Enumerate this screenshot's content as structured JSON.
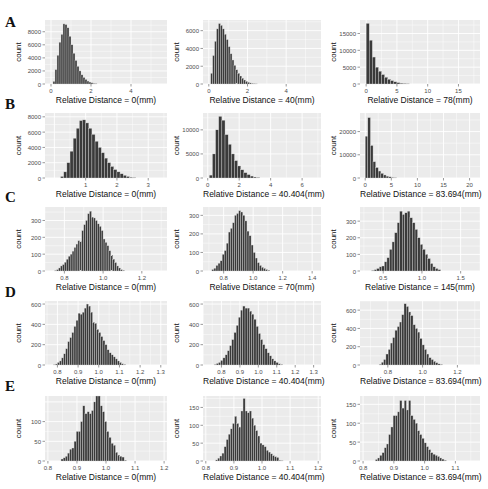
{
  "figure": {
    "rows": [
      "A",
      "B",
      "C",
      "D",
      "E"
    ],
    "colors": {
      "panel_bg": "#ebebeb",
      "grid": "#ffffff",
      "bar_fill": "#3a3a3a",
      "bar_edge": "#d9d9d9",
      "text": "#111111",
      "tick_text": "#4d4d4d"
    },
    "ylabel": "count"
  },
  "chart_data": [
    {
      "id": "A1",
      "row": "A",
      "type": "bar",
      "title": "",
      "xlabel": "Relative Distance = 0(mm)",
      "ylabel": "count",
      "xlim": [
        -0.3,
        5.8
      ],
      "ylim": [
        0,
        9800
      ],
      "xticks": [
        0,
        2,
        4
      ],
      "yticks": [
        0,
        2000,
        4000,
        6000,
        8000
      ],
      "bin_start": 0.1,
      "bin_width": 0.1,
      "values": [
        400,
        2200,
        4400,
        6400,
        7600,
        9200,
        9100,
        8600,
        7300,
        6000,
        4700,
        3600,
        2700,
        2000,
        1400,
        1000,
        700,
        450,
        300,
        180,
        100,
        60
      ]
    },
    {
      "id": "A2",
      "row": "A",
      "type": "bar",
      "title": "",
      "xlabel": "Relative Distance = 40(mm)",
      "ylabel": "count",
      "xlim": [
        -0.3,
        5.8
      ],
      "ylim": [
        0,
        7200
      ],
      "xticks": [
        0,
        2,
        4
      ],
      "yticks": [
        0,
        2000,
        4000,
        6000
      ],
      "bin_start": 0.1,
      "bin_width": 0.1,
      "values": [
        1200,
        3200,
        4800,
        6200,
        6800,
        6600,
        6200,
        5600,
        5000,
        4200,
        3400,
        2700,
        2100,
        1600,
        1200,
        900,
        650,
        450,
        300,
        200,
        120,
        70,
        40,
        20
      ]
    },
    {
      "id": "A3",
      "row": "A",
      "type": "bar",
      "title": "",
      "xlabel": "Relative Distance = 78(mm)",
      "ylabel": "count",
      "xlim": [
        -1,
        18.5
      ],
      "ylim": [
        0,
        19000
      ],
      "xticks": [
        0,
        5,
        10,
        15
      ],
      "yticks": [
        0,
        5000,
        10000,
        15000
      ],
      "bin_start": 0,
      "bin_width": 0.5,
      "values": [
        18000,
        13000,
        8000,
        5000,
        3800,
        2800,
        2000,
        1400,
        1000,
        650,
        400,
        250,
        150,
        80
      ]
    },
    {
      "id": "B1",
      "row": "B",
      "type": "bar",
      "title": "",
      "xlabel": "Relative Distance = 0(mm)",
      "ylabel": "count",
      "xlim": [
        -0.3,
        3.6
      ],
      "ylim": [
        0,
        8500
      ],
      "xticks": [
        1,
        2,
        3
      ],
      "yticks": [
        0,
        2000,
        4000,
        6000,
        8000
      ],
      "bin_start": 0.2,
      "bin_width": 0.1,
      "values": [
        200,
        800,
        2000,
        3500,
        5200,
        6500,
        7500,
        7600,
        7200,
        6500,
        5700,
        4800,
        4000,
        3300,
        2600,
        2000,
        1500,
        1100,
        800,
        550,
        350,
        200,
        100,
        50
      ]
    },
    {
      "id": "B2",
      "row": "B",
      "type": "bar",
      "title": "",
      "xlabel": "Relative Distance = 40.404(mm)",
      "ylabel": "count",
      "xlim": [
        -0.3,
        7.2
      ],
      "ylim": [
        0,
        13500
      ],
      "xticks": [
        0,
        2,
        4,
        6
      ],
      "yticks": [
        0,
        5000,
        10000
      ],
      "bin_start": 0.1,
      "bin_width": 0.2,
      "values": [
        600,
        5000,
        10000,
        12800,
        12000,
        9000,
        7000,
        5000,
        3600,
        2500,
        1700,
        1100,
        700,
        400,
        200,
        100
      ]
    },
    {
      "id": "B3",
      "row": "B",
      "type": "bar",
      "title": "",
      "xlabel": "Relative Distance = 83.694(mm)",
      "ylabel": "count",
      "xlim": [
        -1,
        22
      ],
      "ylim": [
        0,
        28000
      ],
      "xticks": [
        0,
        5,
        10,
        15,
        20
      ],
      "yticks": [
        0,
        10000,
        20000
      ],
      "bin_start": 0,
      "bin_width": 0.5,
      "values": [
        18000,
        26000,
        14000,
        7000,
        4500,
        3000,
        2000,
        1300,
        800,
        500,
        250,
        120
      ]
    },
    {
      "id": "C1",
      "row": "C",
      "type": "bar",
      "title": "",
      "xlabel": "Relative Distance = 0(mm)",
      "ylabel": "count",
      "xlim": [
        0.7,
        1.33
      ],
      "ylim": [
        0,
        380
      ],
      "xticks": [
        0.8,
        1.0,
        1.2
      ],
      "yticks": [
        0,
        100,
        200,
        300
      ],
      "bin_start": 0.75,
      "bin_width": 0.01,
      "values": [
        3,
        8,
        18,
        30,
        38,
        52,
        70,
        88,
        100,
        118,
        140,
        160,
        180,
        175,
        240,
        275,
        300,
        340,
        355,
        320,
        315,
        300,
        280,
        265,
        240,
        190,
        170,
        150,
        120,
        95,
        70,
        50,
        30,
        18,
        8,
        4
      ]
    },
    {
      "id": "C2",
      "row": "C",
      "type": "bar",
      "title": "",
      "xlabel": "Relative Distance = 70(mm)",
      "ylabel": "count",
      "xlim": [
        0.66,
        1.46
      ],
      "ylim": [
        0,
        345
      ],
      "xticks": [
        0.8,
        1.0,
        1.2,
        1.4
      ],
      "yticks": [
        0,
        100,
        200,
        300
      ],
      "bin_start": 0.72,
      "bin_width": 0.014,
      "values": [
        8,
        15,
        30,
        42,
        55,
        90,
        110,
        150,
        210,
        230,
        260,
        300,
        310,
        325,
        318,
        300,
        270,
        215,
        190,
        140,
        100,
        70,
        45,
        30,
        20,
        14,
        8,
        4
      ]
    },
    {
      "id": "C3",
      "row": "C",
      "type": "bar",
      "title": "",
      "xlabel": "Relative Distance = 145(mm)",
      "ylabel": "count",
      "xlim": [
        0.2,
        1.75
      ],
      "ylim": [
        0,
        385
      ],
      "xticks": [
        0.5,
        1.0,
        1.5
      ],
      "yticks": [
        0,
        100,
        200,
        300
      ],
      "bin_start": 0.35,
      "bin_width": 0.033,
      "values": [
        3,
        8,
        15,
        25,
        30,
        55,
        80,
        130,
        175,
        230,
        290,
        360,
        340,
        350,
        360,
        320,
        290,
        250,
        200,
        160,
        130,
        100,
        75,
        45,
        25,
        15,
        8
      ]
    },
    {
      "id": "D1",
      "row": "D",
      "type": "bar",
      "title": "",
      "xlabel": "Relative Distance = 0(mm)",
      "ylabel": "count",
      "xlim": [
        0.74,
        1.33
      ],
      "ylim": [
        0,
        630
      ],
      "xticks": [
        0.8,
        0.9,
        1.0,
        1.1,
        1.2,
        1.3
      ],
      "yticks": [
        0,
        200,
        400,
        600
      ],
      "bin_start": 0.78,
      "bin_width": 0.01,
      "values": [
        3,
        10,
        25,
        40,
        70,
        110,
        160,
        230,
        270,
        320,
        380,
        440,
        510,
        500,
        520,
        560,
        600,
        580,
        520,
        420,
        410,
        350,
        320,
        280,
        240,
        200,
        150,
        120,
        100,
        80,
        60,
        40,
        25,
        12,
        5
      ]
    },
    {
      "id": "D2",
      "row": "D",
      "type": "bar",
      "title": "",
      "xlabel": "Relative Distance = 40.404(mm)",
      "ylabel": "count",
      "xlim": [
        0.7,
        1.34
      ],
      "ylim": [
        0,
        630
      ],
      "xticks": [
        0.8,
        0.9,
        1.0,
        1.1,
        1.2,
        1.3
      ],
      "yticks": [
        0,
        200,
        400,
        600
      ],
      "bin_start": 0.76,
      "bin_width": 0.012,
      "values": [
        5,
        15,
        25,
        45,
        70,
        100,
        140,
        190,
        250,
        320,
        390,
        470,
        540,
        580,
        560,
        560,
        530,
        500,
        450,
        380,
        310,
        250,
        200,
        160,
        120,
        90,
        60,
        40,
        25,
        12,
        5
      ]
    },
    {
      "id": "D3",
      "row": "D",
      "type": "bar",
      "title": "",
      "xlabel": "Relative Distance = 83.694(mm)",
      "ylabel": "count",
      "xlim": [
        0.64,
        1.33
      ],
      "ylim": [
        0,
        700
      ],
      "xticks": [
        0.8,
        1.0,
        1.2
      ],
      "yticks": [
        0,
        200,
        400,
        600
      ],
      "bin_start": 0.75,
      "bin_width": 0.013,
      "values": [
        8,
        30,
        60,
        120,
        170,
        240,
        300,
        380,
        420,
        470,
        550,
        670,
        640,
        580,
        540,
        440,
        400,
        360,
        290,
        220,
        170,
        120,
        80,
        60,
        40,
        25,
        12,
        6
      ]
    },
    {
      "id": "E1",
      "row": "E",
      "type": "bar",
      "title": "",
      "xlabel": "Relative Distance = 0(mm)",
      "ylabel": "count",
      "xlim": [
        0.79,
        1.21
      ],
      "ylim": [
        0,
        165
      ],
      "xticks": [
        0.8,
        0.9,
        1.0,
        1.1,
        1.2
      ],
      "yticks": [
        0,
        50,
        100
      ],
      "bin_start": 0.845,
      "bin_width": 0.0075,
      "values": [
        5,
        8,
        12,
        20,
        30,
        33,
        50,
        75,
        75,
        100,
        140,
        120,
        125,
        120,
        128,
        150,
        165,
        165,
        140,
        125,
        100,
        75,
        60,
        45,
        40,
        22,
        15,
        12,
        10,
        2
      ]
    },
    {
      "id": "E2",
      "row": "E",
      "type": "bar",
      "title": "",
      "xlabel": "Relative Distance = 40.404(mm)",
      "ylabel": "count",
      "xlim": [
        0.79,
        1.21
      ],
      "ylim": [
        0,
        182
      ],
      "xticks": [
        0.8,
        0.9,
        1.0,
        1.1,
        1.2
      ],
      "yticks": [
        0,
        50,
        100,
        150
      ],
      "bin_start": 0.835,
      "bin_width": 0.0075,
      "values": [
        3,
        8,
        14,
        22,
        40,
        60,
        75,
        90,
        105,
        125,
        105,
        95,
        140,
        175,
        140,
        135,
        140,
        120,
        100,
        85,
        70,
        50,
        45,
        40,
        30,
        25,
        20,
        15,
        12,
        10,
        2,
        1
      ]
    },
    {
      "id": "E3",
      "row": "E",
      "type": "bar",
      "title": "",
      "xlabel": "Relative Distance = 83.694(mm)",
      "ylabel": "count",
      "xlim": [
        0.79,
        1.18
      ],
      "ylim": [
        0,
        172
      ],
      "xticks": [
        0.8,
        0.9,
        1.0,
        1.1
      ],
      "yticks": [
        0,
        50,
        100,
        150
      ],
      "bin_start": 0.84,
      "bin_width": 0.0072,
      "values": [
        4,
        8,
        15,
        22,
        35,
        45,
        70,
        90,
        120,
        120,
        130,
        160,
        140,
        160,
        135,
        160,
        120,
        110,
        100,
        80,
        70,
        60,
        48,
        38,
        30,
        22,
        18,
        15,
        12,
        8,
        5,
        2
      ]
    }
  ]
}
